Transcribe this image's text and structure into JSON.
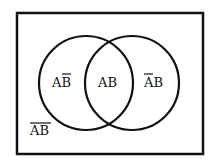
{
  "diagram": {
    "type": "venn",
    "universe": {
      "label": "AB",
      "negate_a": true,
      "negate_b": true
    },
    "sets": [
      {
        "name": "A",
        "region_label": "AB",
        "negate_b": true
      },
      {
        "name": "B",
        "region_label": "AB",
        "negate_a": true
      }
    ],
    "intersection": {
      "label": "AB"
    },
    "labels": {
      "a_only": "AB",
      "intersection": "AB",
      "b_only": "AB",
      "neither": "AB"
    },
    "colors": {
      "stroke": "#111111",
      "background": "#ffffff"
    }
  }
}
